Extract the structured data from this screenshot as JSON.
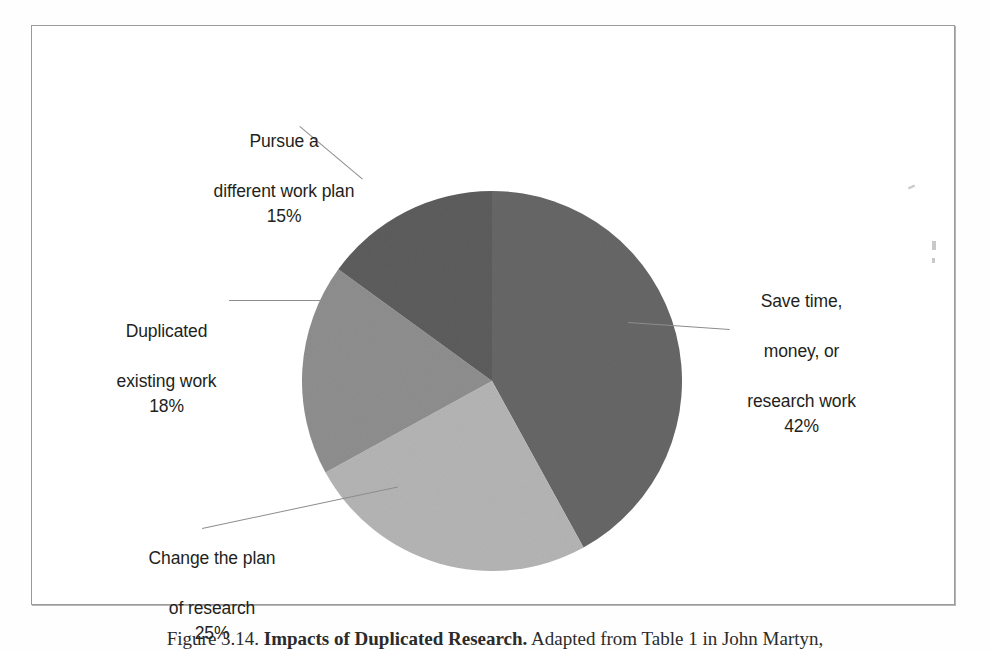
{
  "figure": {
    "frame_color": "#9a9a9a",
    "background": "#ffffff"
  },
  "caption": {
    "prefix": "Figure 3.14. ",
    "title": "Impacts of Duplicated Research.",
    "suffix": " Adapted from Table 1 in John Martyn,"
  },
  "chart_data": {
    "type": "pie",
    "title": "",
    "subtitle": "",
    "xlabel": "",
    "ylabel": "",
    "grid": false,
    "legend_position": "none",
    "start_angle_deg": 0,
    "direction": "clockwise",
    "center_px": [
      460,
      355
    ],
    "radius_px": 190,
    "categories": [
      "Save time, money, or research work",
      "Change the plan of research",
      "Duplicated existing work",
      "Pursue a different work plan"
    ],
    "values": [
      42,
      25,
      18,
      15
    ],
    "value_unit": "%",
    "slice_colors": [
      "#676767",
      "#b5b5b5",
      "#8f8f8f",
      "#5d5d5d"
    ],
    "slices": [
      {
        "label": "Save time, money, or research work",
        "label_lines": [
          "Save time,",
          "money, or",
          "research work"
        ],
        "value": 42,
        "display_value": "42%",
        "color": "#676767",
        "start_deg": 0,
        "end_deg": 151.2
      },
      {
        "label": "Change the plan of research",
        "label_lines": [
          "Change the plan",
          "of research"
        ],
        "value": 25,
        "display_value": "25%",
        "color": "#b5b5b5",
        "start_deg": 151.2,
        "end_deg": 241.2
      },
      {
        "label": "Duplicated existing work",
        "label_lines": [
          "Duplicated",
          "existing work"
        ],
        "value": 18,
        "display_value": "18%",
        "color": "#8f8f8f",
        "start_deg": 241.2,
        "end_deg": 306.0
      },
      {
        "label": "Pursue a different work plan",
        "label_lines": [
          "Pursue a",
          "different work plan"
        ],
        "value": 15,
        "display_value": "15%",
        "color": "#5d5d5d",
        "start_deg": 306.0,
        "end_deg": 360.0
      }
    ]
  },
  "labels": {
    "pursue": {
      "line1": "Pursue a",
      "line2": "different work plan",
      "percent": "15%"
    },
    "duplicated": {
      "line1": "Duplicated",
      "line2": "existing work",
      "percent": "18%"
    },
    "change": {
      "line1": "Change the plan",
      "line2": "of research",
      "percent": "25%"
    },
    "save": {
      "line1": "Save time,",
      "line2": "money, or",
      "line3": "research work",
      "percent": "42%"
    }
  }
}
